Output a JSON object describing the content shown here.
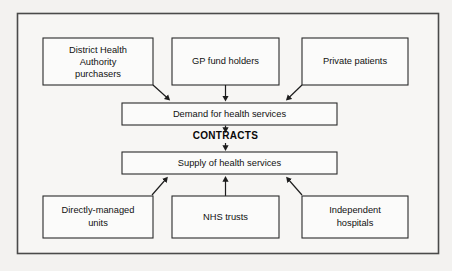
{
  "diagram": {
    "background_color": "#f3f2f0",
    "frame_color": "#4a4a4a",
    "box_fill": "#fbfbfa",
    "box_stroke": "#2b2b2b",
    "line_color": "#1d1d1d",
    "purchaser_boxes": [
      {
        "id": "district-health-authority-purchasers",
        "lines": [
          "District Health",
          "Authority",
          "purchasers"
        ]
      },
      {
        "id": "gp-fund-holders",
        "lines": [
          "GP fund holders"
        ]
      },
      {
        "id": "private-patients",
        "lines": [
          "Private patients"
        ]
      }
    ],
    "demand_box": {
      "id": "demand-for-health-services",
      "label": "Demand for health services"
    },
    "contracts_label": "CONTRACTS",
    "supply_box": {
      "id": "supply-of-health-services",
      "label": "Supply of health services"
    },
    "provider_boxes": [
      {
        "id": "directly-managed-units",
        "lines": [
          "Directly-managed",
          "units"
        ]
      },
      {
        "id": "nhs-trusts",
        "lines": [
          "NHS trusts"
        ]
      },
      {
        "id": "independent-hospitals",
        "lines": [
          "Independent",
          "hospitals"
        ]
      }
    ]
  }
}
